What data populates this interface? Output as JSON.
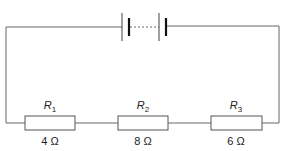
{
  "diagram": {
    "type": "series circuit",
    "battery": {
      "name": "battery of cells",
      "cells_shown": 2,
      "connection": "dashed (multiple cells)"
    },
    "resistors": [
      {
        "label": "R",
        "subscript": "1",
        "value": "4 Ω"
      },
      {
        "label": "R",
        "subscript": "2",
        "value": "8 Ω"
      },
      {
        "label": "R",
        "subscript": "3",
        "value": "6 Ω"
      }
    ],
    "colors": {
      "wire": "#555555",
      "plate": "#111111",
      "text": "#222222"
    }
  }
}
